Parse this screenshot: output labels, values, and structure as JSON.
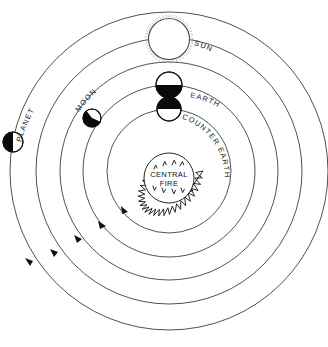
{
  "diagram": {
    "center_label_line1": "CENTRAL",
    "center_label_line2": "FIRE",
    "labels": {
      "sun": "SUN",
      "moon": "MOON",
      "earth": "EARTH",
      "counter_earth": "COUNTER EARTH",
      "planet": "PLANET"
    },
    "colors": {
      "background": "#ffffff",
      "orbit_stroke": "#3d3d3d",
      "body_outline": "#111111",
      "body_dark": "#0a0a0a",
      "body_light": "#ffffff",
      "text": "#1a1a1a",
      "sun_ray": "#8c8c8c"
    },
    "center": {
      "x": 169,
      "y": 171
    },
    "orbits": [
      {
        "name": "counter-earth-orbit",
        "radius": 62,
        "arrow_angle_deg": 131
      },
      {
        "name": "earth-orbit",
        "radius": 86,
        "arrow_angle_deg": 139
      },
      {
        "name": "moon-orbit",
        "radius": 109,
        "arrow_angle_deg": 147
      },
      {
        "name": "sun-orbit",
        "radius": 133,
        "arrow_angle_deg": 152
      },
      {
        "name": "planet-orbit",
        "radius": 159,
        "arrow_angle_deg": 156
      }
    ],
    "bodies": [
      {
        "name": "counter-earth",
        "orbit": "counter-earth-orbit",
        "radius": 12,
        "shading": "top-dark",
        "angle_deg": 273
      },
      {
        "name": "earth",
        "orbit": "earth-orbit",
        "radius": 13,
        "shading": "bottom-dark",
        "angle_deg": 275
      },
      {
        "name": "moon",
        "orbit": "moon-orbit",
        "radius": 9,
        "shading": "wedge-dark",
        "angle_deg": 225
      },
      {
        "name": "sun",
        "orbit": "sun-orbit",
        "radius": 21,
        "shading": "rayed-open",
        "angle_deg": 285
      },
      {
        "name": "planet",
        "orbit": "planet-orbit",
        "radius": 10,
        "shading": "left-dark",
        "angle_deg": 187
      }
    ],
    "central_fire": {
      "outer_radius": 34,
      "inner_radius": 27,
      "spike_count": 30,
      "flame_count": 6
    },
    "rotation_direction": "counterclockwise"
  }
}
